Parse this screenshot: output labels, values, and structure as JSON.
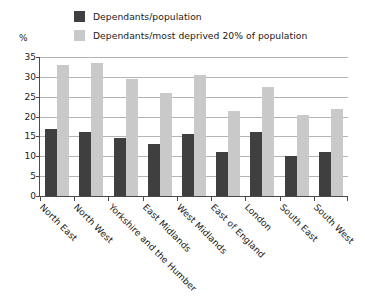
{
  "chart_data": {
    "type": "bar",
    "title": "",
    "xlabel": "",
    "ylabel": "%",
    "ylim": [
      0,
      35
    ],
    "yticks": [
      0,
      5,
      10,
      15,
      20,
      25,
      30,
      35
    ],
    "grid": true,
    "legend_position": "top",
    "categories": [
      "North East",
      "North West",
      "Yorkshire and the Humber",
      "East Midlands",
      "West Midlands",
      "East of England",
      "London",
      "South East",
      "South West"
    ],
    "series": [
      {
        "name": "Dependants/population",
        "color": "#3f3f3f",
        "values": [
          17.0,
          16.0,
          14.5,
          13.0,
          15.5,
          11.0,
          16.0,
          10.0,
          11.0
        ]
      },
      {
        "name": "Dependants/most deprived 20% of population",
        "color": "#c9c9c9",
        "values": [
          33.0,
          33.5,
          29.5,
          26.0,
          30.5,
          21.5,
          27.5,
          20.5,
          22.0
        ]
      }
    ]
  },
  "axis": {
    "unit_label": "%"
  }
}
